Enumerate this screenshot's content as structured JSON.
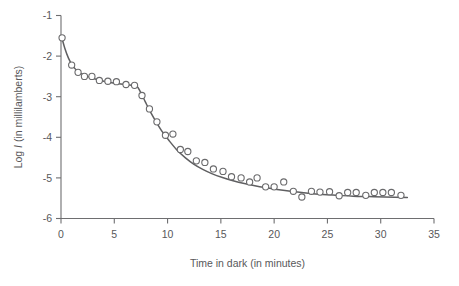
{
  "chart_data": {
    "type": "scatter",
    "title": "",
    "xlabel": "Time in dark (in minutes)",
    "ylabel_prefix": "Log ",
    "ylabel_var": "I",
    "ylabel_suffix": " (in millilamberts)",
    "xlim": [
      0,
      35
    ],
    "ylim": [
      -6,
      -1
    ],
    "xticks": [
      0,
      5,
      10,
      15,
      20,
      25,
      30,
      35
    ],
    "xtick_labels": [
      "0",
      "5",
      "10",
      "15",
      "20",
      "25",
      "30",
      "35"
    ],
    "yticks": [
      -1,
      -2,
      -3,
      -4,
      -5,
      -6
    ],
    "ytick_labels": [
      "-1",
      "-2",
      "-3",
      "-4",
      "-5",
      "-6"
    ],
    "grid": false,
    "legend": false,
    "marker_style": "open-circle",
    "marker_color": "#6a6a6c",
    "curve_color": "#5f5f61",
    "axis_color": "#6e6e70",
    "points": [
      [
        0.1,
        -1.55
      ],
      [
        1.0,
        -2.22
      ],
      [
        1.6,
        -2.4
      ],
      [
        2.2,
        -2.5
      ],
      [
        2.9,
        -2.5
      ],
      [
        3.6,
        -2.6
      ],
      [
        4.4,
        -2.62
      ],
      [
        5.2,
        -2.63
      ],
      [
        6.1,
        -2.7
      ],
      [
        6.9,
        -2.72
      ],
      [
        7.6,
        -2.97
      ],
      [
        8.3,
        -3.3
      ],
      [
        9.0,
        -3.62
      ],
      [
        9.8,
        -3.95
      ],
      [
        10.5,
        -3.92
      ],
      [
        11.2,
        -4.3
      ],
      [
        11.9,
        -4.35
      ],
      [
        12.7,
        -4.58
      ],
      [
        13.5,
        -4.62
      ],
      [
        14.3,
        -4.78
      ],
      [
        15.2,
        -4.84
      ],
      [
        16.0,
        -4.97
      ],
      [
        16.9,
        -5.0
      ],
      [
        17.7,
        -5.1
      ],
      [
        18.4,
        -5.0
      ],
      [
        19.2,
        -5.22
      ],
      [
        20.0,
        -5.22
      ],
      [
        20.9,
        -5.1
      ],
      [
        21.8,
        -5.33
      ],
      [
        22.6,
        -5.47
      ],
      [
        23.5,
        -5.33
      ],
      [
        24.3,
        -5.35
      ],
      [
        25.2,
        -5.34
      ],
      [
        26.1,
        -5.44
      ],
      [
        26.9,
        -5.36
      ],
      [
        27.7,
        -5.36
      ],
      [
        28.6,
        -5.43
      ],
      [
        29.4,
        -5.36
      ],
      [
        30.2,
        -5.36
      ],
      [
        31.0,
        -5.36
      ],
      [
        31.9,
        -5.43
      ]
    ],
    "fit_curve": [
      [
        0.05,
        -1.52
      ],
      [
        0.35,
        -1.8
      ],
      [
        0.7,
        -2.05
      ],
      [
        1.1,
        -2.24
      ],
      [
        1.6,
        -2.38
      ],
      [
        2.2,
        -2.47
      ],
      [
        2.9,
        -2.54
      ],
      [
        3.7,
        -2.6
      ],
      [
        4.6,
        -2.65
      ],
      [
        5.6,
        -2.69
      ],
      [
        6.6,
        -2.72
      ],
      [
        7.1,
        -2.74
      ],
      [
        7.45,
        -2.88
      ],
      [
        7.9,
        -3.12
      ],
      [
        8.4,
        -3.38
      ],
      [
        8.95,
        -3.63
      ],
      [
        9.55,
        -3.88
      ],
      [
        10.2,
        -4.1
      ],
      [
        10.9,
        -4.32
      ],
      [
        11.65,
        -4.5
      ],
      [
        12.45,
        -4.66
      ],
      [
        13.3,
        -4.79
      ],
      [
        14.2,
        -4.9
      ],
      [
        15.15,
        -4.99
      ],
      [
        16.15,
        -5.07
      ],
      [
        17.2,
        -5.14
      ],
      [
        18.3,
        -5.2
      ],
      [
        19.45,
        -5.25
      ],
      [
        20.65,
        -5.3
      ],
      [
        21.9,
        -5.34
      ],
      [
        23.2,
        -5.38
      ],
      [
        24.55,
        -5.41
      ],
      [
        25.95,
        -5.43
      ],
      [
        27.4,
        -5.45
      ],
      [
        28.9,
        -5.46
      ],
      [
        30.4,
        -5.47
      ],
      [
        32.5,
        -5.48
      ]
    ]
  }
}
